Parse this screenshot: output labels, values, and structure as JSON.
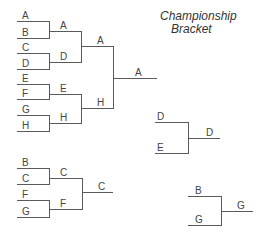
{
  "title": {
    "line1": "Championship",
    "line2": "Bracket"
  },
  "colors": {
    "line": "#5a5a5a",
    "text": "#444444",
    "background": "#ffffff"
  },
  "main_bracket": {
    "round1": [
      "A",
      "B",
      "C",
      "D",
      "E",
      "F",
      "G",
      "H"
    ],
    "round2": [
      "A",
      "D",
      "E",
      "H"
    ],
    "round3": [
      "A",
      "H"
    ],
    "winner": "A"
  },
  "consolation_bracket": {
    "round1": [
      "B",
      "C",
      "F",
      "G"
    ],
    "round2": [
      "C",
      "F"
    ],
    "winner": "C"
  },
  "match_de": {
    "entrants": [
      "D",
      "E"
    ],
    "winner": "D"
  },
  "match_bg": {
    "entrants": [
      "B",
      "G"
    ],
    "winner": "G"
  }
}
